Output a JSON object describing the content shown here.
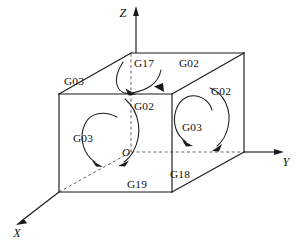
{
  "figure": {
    "background_color": "#ffffff",
    "line_color": "#1a1a1a",
    "hidden_line_color": "#555555"
  },
  "axes": [
    {
      "name": "z-axis",
      "label": "Z",
      "direction": "up",
      "label_x": 123,
      "label_y": 16
    },
    {
      "name": "y-axis",
      "label": "Y",
      "direction": "right",
      "label_x": 286,
      "label_y": 166
    },
    {
      "name": "x-axis",
      "label": "X",
      "direction": "down-left",
      "label_x": 16,
      "label_y": 236
    }
  ],
  "origin": {
    "label": "O",
    "x": 129,
    "y": 155
  },
  "labels": [
    {
      "id": "top-left-g03",
      "text": "G03",
      "x": 74,
      "y": 85,
      "face": "top",
      "plane": "G17"
    },
    {
      "id": "top-g17",
      "text": "G17",
      "x": 144,
      "y": 67,
      "face": "top",
      "plane": "G17"
    },
    {
      "id": "top-right-g02",
      "text": "G02",
      "x": 189,
      "y": 67,
      "face": "top",
      "plane": "G17"
    },
    {
      "id": "front-g02",
      "text": "G02",
      "x": 144,
      "y": 110,
      "face": "front",
      "plane": "G19"
    },
    {
      "id": "front-g03",
      "text": "G03",
      "x": 83,
      "y": 142,
      "face": "front",
      "plane": "G19"
    },
    {
      "id": "front-g19",
      "text": "G19",
      "x": 137,
      "y": 188,
      "face": "front",
      "plane": "G19"
    },
    {
      "id": "right-g02",
      "text": "G02",
      "x": 221,
      "y": 95,
      "face": "right",
      "plane": "G18"
    },
    {
      "id": "right-g03",
      "text": "G03",
      "x": 192,
      "y": 131,
      "face": "right",
      "plane": "G18"
    },
    {
      "id": "right-g18",
      "text": "G18",
      "x": 180,
      "y": 178,
      "face": "right",
      "plane": "G18"
    }
  ],
  "arcs": [
    {
      "id": "top-arc",
      "plane": "G17",
      "direction": "both-ends-down",
      "description": "U-shaped arc on top face with arrowheads at both ends"
    },
    {
      "id": "front-arc-left",
      "plane": "G19",
      "direction": "counterclockwise",
      "description": "open circle arc on front face, arrow at lower right"
    },
    {
      "id": "front-arc-center",
      "plane": "G19",
      "direction": "clockwise",
      "description": "vertical arc near origin, arrow at bottom"
    },
    {
      "id": "right-arc-outer",
      "plane": "G18",
      "direction": "clockwise",
      "description": "outer arc on right face, arrow at lower right"
    },
    {
      "id": "right-arc-inner",
      "plane": "G18",
      "direction": "counterclockwise",
      "description": "inner arc on right face, arrow at lower left"
    }
  ],
  "box": {
    "name": "reference-cube",
    "front_top_left": [
      59,
      94
    ],
    "front_top_right": [
      172,
      94
    ],
    "front_bottom_left": [
      59,
      192
    ],
    "front_bottom_right": [
      172,
      192
    ],
    "back_top_left": [
      131,
      53
    ],
    "back_top_right": [
      244,
      53
    ],
    "back_bottom_right": [
      244,
      152
    ]
  }
}
